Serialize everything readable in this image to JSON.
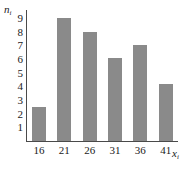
{
  "chart_data": {
    "type": "bar",
    "title": "",
    "subtitle": "",
    "xlabel": "x",
    "xlabel_sub": "i",
    "ylabel": "n",
    "ylabel_sub": "i",
    "categories": [
      "16",
      "21",
      "26",
      "31",
      "36",
      "41"
    ],
    "values": [
      2.5,
      9.0,
      8.0,
      6.1,
      7.0,
      4.2
    ],
    "xticks": [
      "16",
      "21",
      "26",
      "31",
      "36",
      "41"
    ],
    "yticks": [
      "1",
      "2",
      "3",
      "4",
      "5",
      "6",
      "7",
      "8",
      "9"
    ],
    "ylim": [
      0,
      9.6
    ],
    "xlim": [
      0,
      6
    ],
    "grid": false,
    "legend": null,
    "bar_color": "#8a8a8a",
    "axis_color": "#4a4a4a",
    "background": "#ffffff"
  }
}
